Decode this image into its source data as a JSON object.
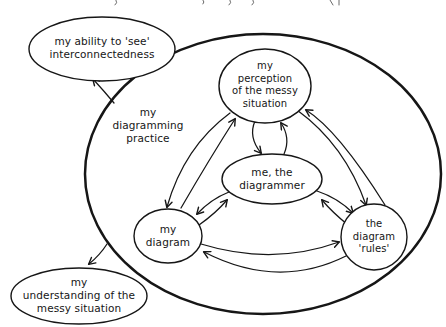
{
  "figure": {
    "type": "hand-drawn systems influence diagram",
    "colors": {
      "ink": "#161616",
      "background": "#ffffff",
      "node_fill": "#ffffff"
    },
    "outer_boundary": {
      "id": "my-diagramming-practice",
      "label": "my\ndiagramming\npractice"
    },
    "nodes": [
      {
        "id": "my-ability",
        "label": "my ability to 'see'\ninterconnectedness",
        "inside_boundary": false
      },
      {
        "id": "my-perception",
        "label": "my\nperception\nof the messy\nsituation",
        "inside_boundary": true
      },
      {
        "id": "me-the-diagrammer",
        "label": "me, the\ndiagrammer",
        "inside_boundary": true
      },
      {
        "id": "my-diagram",
        "label": "my\ndiagram",
        "inside_boundary": true
      },
      {
        "id": "the-diagram-rules",
        "label": "the\ndiagram\n'rules'",
        "inside_boundary": true
      },
      {
        "id": "my-understanding",
        "label": "my\nunderstanding of the\nmessy situation",
        "inside_boundary": false
      }
    ],
    "edges": [
      {
        "from": "my-perception",
        "to": "me-the-diagrammer",
        "bidirectional": true
      },
      {
        "from": "my-perception",
        "to": "my-diagram",
        "bidirectional": true
      },
      {
        "from": "my-perception",
        "to": "the-diagram-rules",
        "bidirectional": true
      },
      {
        "from": "me-the-diagrammer",
        "to": "my-diagram",
        "bidirectional": true
      },
      {
        "from": "me-the-diagrammer",
        "to": "the-diagram-rules",
        "bidirectional": true
      },
      {
        "from": "my-diagram",
        "to": "the-diagram-rules",
        "bidirectional": true
      },
      {
        "from": "my-diagramming-practice",
        "to": "my-ability",
        "bidirectional": false
      },
      {
        "from": "my-diagramming-practice",
        "to": "my-understanding",
        "bidirectional": false
      }
    ]
  }
}
